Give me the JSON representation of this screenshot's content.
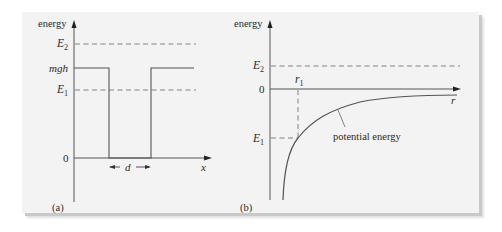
{
  "figure": {
    "panel_a": {
      "tag": "(a)",
      "y_axis_label": "energy",
      "x_axis_label": "x",
      "levels": {
        "E2": {
          "base": "E",
          "sub": "2"
        },
        "mgh": "mgh",
        "E1": {
          "base": "E",
          "sub": "1"
        },
        "zero": "0"
      },
      "width_label": "d"
    },
    "panel_b": {
      "tag": "(b)",
      "y_axis_label": "energy",
      "x_axis_label": "r",
      "levels": {
        "E2": {
          "base": "E",
          "sub": "2"
        },
        "zero": "0",
        "E1": {
          "base": "E",
          "sub": "1"
        }
      },
      "r1": {
        "base": "r",
        "sub": "1"
      },
      "curve_label": "potential energy"
    }
  },
  "colors": {
    "background": "#f3f3f3",
    "line": "#555555",
    "dash": "#777777",
    "text": "#2a2a2a"
  }
}
